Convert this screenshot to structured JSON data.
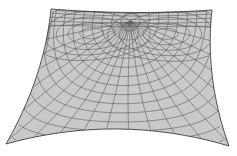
{
  "figure": {
    "width": 237,
    "height": 156,
    "colors": {
      "background": "#ffffff",
      "surface_fill": "#c9c9c9",
      "grid_line": "#5a5a5a",
      "edge_line": "#3a3a3a"
    },
    "corners": {
      "top_left": [
        51,
        9
      ],
      "top_right": [
        212,
        10
      ],
      "bottom_left": [
        6,
        144
      ],
      "bottom_right": [
        229,
        146
      ]
    },
    "edge_sag": {
      "top": 3,
      "bottom": -16,
      "left": 8,
      "right": -8
    },
    "grid": {
      "radial_lines": 22,
      "ring_lines": 16,
      "center": [
        0.5,
        0.08
      ]
    }
  }
}
